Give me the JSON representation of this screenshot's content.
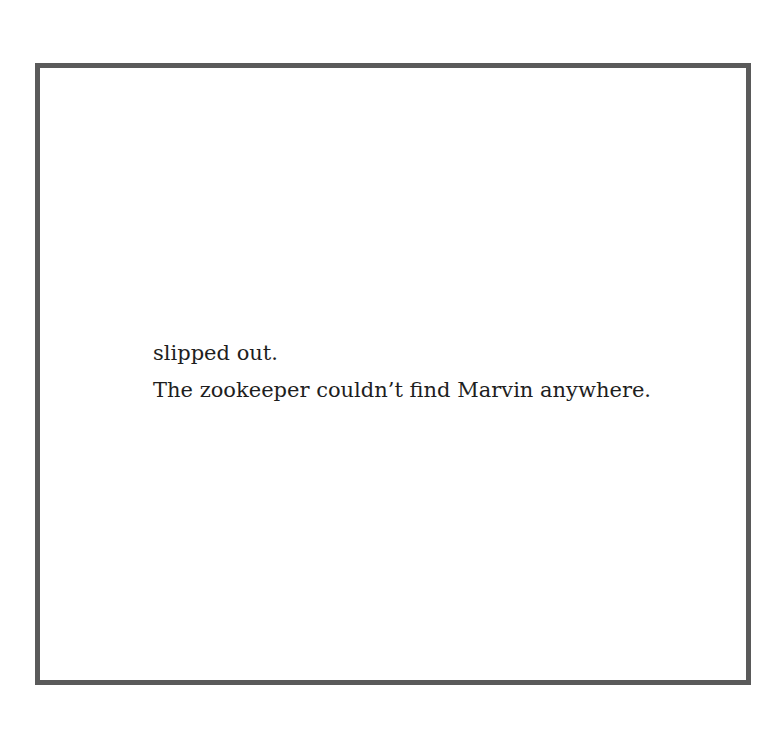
{
  "page": {
    "frame_color": "#5a5a5a",
    "lines": [
      "slipped out.",
      "The zookeeper couldn’t find Marvin anywhere."
    ]
  }
}
